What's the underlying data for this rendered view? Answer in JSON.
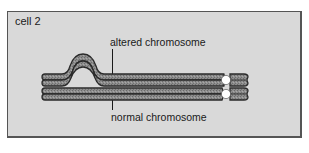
{
  "figure": {
    "panel_label": "cell 2",
    "labels": {
      "altered": "altered chromosome",
      "normal": "normal chromosome"
    },
    "colors": {
      "background": "#d9d9d9",
      "frame_border": "#555555",
      "chromatid_fill": "#8c8c8c",
      "chromatid_outline": "#2a2a2a",
      "centromere": "#ffffff"
    },
    "chromosomes": [
      {
        "name": "altered chromosome",
        "feature": "loop / insertion bubble",
        "centromere": "white circle"
      },
      {
        "name": "normal chromosome",
        "feature": "none",
        "centromere": "white circle"
      }
    ]
  }
}
